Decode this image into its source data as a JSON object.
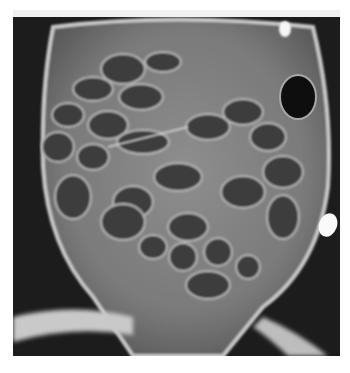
{
  "image": {
    "kind": "radiograph",
    "description": "Abdominal X-ray showing multiple gas-filled, distended bowel loops",
    "colors": {
      "background": "#ffffff",
      "film_dark": "#1c1c1c",
      "soft_tissue": "#8a8a8a",
      "bowel_gas": "#3a3a3a",
      "bone": "#d8d8d8",
      "marker": "#f5f5f5"
    }
  }
}
